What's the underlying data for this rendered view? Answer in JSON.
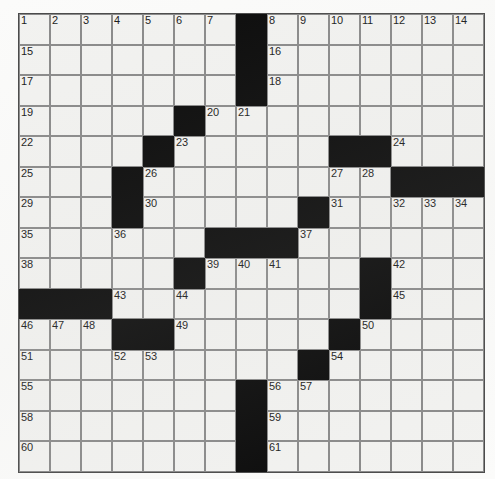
{
  "document": {
    "type": "crossword-puzzle",
    "title": "Crossword Puzzle Grid"
  },
  "grid": {
    "rows": 15,
    "columns": 15,
    "cell_size_px": 31,
    "colors": {
      "open_cell": "#f2f2f0",
      "block_cell": "#0a0a0a",
      "gridline": "#8a8a8a",
      "border": "#4a4a4a",
      "number_text": "#1a1a1a",
      "page_background": "#fbfbfa"
    },
    "blocks": [
      [
        0,
        7
      ],
      [
        1,
        7
      ],
      [
        2,
        7
      ],
      [
        3,
        5
      ],
      [
        4,
        4
      ],
      [
        4,
        10
      ],
      [
        4,
        11
      ],
      [
        5,
        3
      ],
      [
        5,
        12
      ],
      [
        5,
        13
      ],
      [
        5,
        14
      ],
      [
        6,
        3
      ],
      [
        6,
        9
      ],
      [
        7,
        6
      ],
      [
        7,
        7
      ],
      [
        7,
        8
      ],
      [
        8,
        5
      ],
      [
        8,
        11
      ],
      [
        9,
        0
      ],
      [
        9,
        1
      ],
      [
        9,
        2
      ],
      [
        9,
        11
      ],
      [
        10,
        3
      ],
      [
        10,
        4
      ],
      [
        10,
        10
      ],
      [
        11,
        9
      ],
      [
        12,
        7
      ],
      [
        13,
        7
      ],
      [
        14,
        7
      ]
    ],
    "numbers": [
      {
        "row": 0,
        "col": 0,
        "n": "1"
      },
      {
        "row": 0,
        "col": 1,
        "n": "2"
      },
      {
        "row": 0,
        "col": 2,
        "n": "3"
      },
      {
        "row": 0,
        "col": 3,
        "n": "4"
      },
      {
        "row": 0,
        "col": 4,
        "n": "5"
      },
      {
        "row": 0,
        "col": 5,
        "n": "6"
      },
      {
        "row": 0,
        "col": 6,
        "n": "7"
      },
      {
        "row": 0,
        "col": 8,
        "n": "8"
      },
      {
        "row": 0,
        "col": 9,
        "n": "9"
      },
      {
        "row": 0,
        "col": 10,
        "n": "10"
      },
      {
        "row": 0,
        "col": 11,
        "n": "11"
      },
      {
        "row": 0,
        "col": 12,
        "n": "12"
      },
      {
        "row": 0,
        "col": 13,
        "n": "13"
      },
      {
        "row": 0,
        "col": 14,
        "n": "14"
      },
      {
        "row": 1,
        "col": 0,
        "n": "15"
      },
      {
        "row": 1,
        "col": 8,
        "n": "16"
      },
      {
        "row": 2,
        "col": 0,
        "n": "17"
      },
      {
        "row": 2,
        "col": 8,
        "n": "18"
      },
      {
        "row": 3,
        "col": 0,
        "n": "19"
      },
      {
        "row": 3,
        "col": 6,
        "n": "20"
      },
      {
        "row": 3,
        "col": 7,
        "n": "21"
      },
      {
        "row": 4,
        "col": 0,
        "n": "22"
      },
      {
        "row": 4,
        "col": 5,
        "n": "23"
      },
      {
        "row": 4,
        "col": 12,
        "n": "24"
      },
      {
        "row": 5,
        "col": 0,
        "n": "25"
      },
      {
        "row": 5,
        "col": 4,
        "n": "26"
      },
      {
        "row": 5,
        "col": 10,
        "n": "27"
      },
      {
        "row": 5,
        "col": 11,
        "n": "28"
      },
      {
        "row": 6,
        "col": 0,
        "n": "29"
      },
      {
        "row": 6,
        "col": 4,
        "n": "30"
      },
      {
        "row": 6,
        "col": 10,
        "n": "31"
      },
      {
        "row": 6,
        "col": 12,
        "n": "32"
      },
      {
        "row": 6,
        "col": 13,
        "n": "33"
      },
      {
        "row": 6,
        "col": 14,
        "n": "34"
      },
      {
        "row": 7,
        "col": 0,
        "n": "35"
      },
      {
        "row": 7,
        "col": 3,
        "n": "36"
      },
      {
        "row": 7,
        "col": 9,
        "n": "37"
      },
      {
        "row": 8,
        "col": 0,
        "n": "38"
      },
      {
        "row": 8,
        "col": 6,
        "n": "39"
      },
      {
        "row": 8,
        "col": 7,
        "n": "40"
      },
      {
        "row": 8,
        "col": 8,
        "n": "41"
      },
      {
        "row": 8,
        "col": 12,
        "n": "42"
      },
      {
        "row": 9,
        "col": 3,
        "n": "43"
      },
      {
        "row": 9,
        "col": 5,
        "n": "44"
      },
      {
        "row": 9,
        "col": 12,
        "n": "45"
      },
      {
        "row": 10,
        "col": 0,
        "n": "46"
      },
      {
        "row": 10,
        "col": 1,
        "n": "47"
      },
      {
        "row": 10,
        "col": 2,
        "n": "48"
      },
      {
        "row": 10,
        "col": 5,
        "n": "49"
      },
      {
        "row": 10,
        "col": 11,
        "n": "50"
      },
      {
        "row": 11,
        "col": 0,
        "n": "51"
      },
      {
        "row": 11,
        "col": 3,
        "n": "52"
      },
      {
        "row": 11,
        "col": 4,
        "n": "53"
      },
      {
        "row": 11,
        "col": 10,
        "n": "54"
      },
      {
        "row": 12,
        "col": 0,
        "n": "55"
      },
      {
        "row": 12,
        "col": 8,
        "n": "56"
      },
      {
        "row": 12,
        "col": 9,
        "n": "57"
      },
      {
        "row": 13,
        "col": 0,
        "n": "58"
      },
      {
        "row": 13,
        "col": 8,
        "n": "59"
      },
      {
        "row": 14,
        "col": 0,
        "n": "60"
      },
      {
        "row": 14,
        "col": 8,
        "n": "61"
      }
    ],
    "entries": []
  }
}
